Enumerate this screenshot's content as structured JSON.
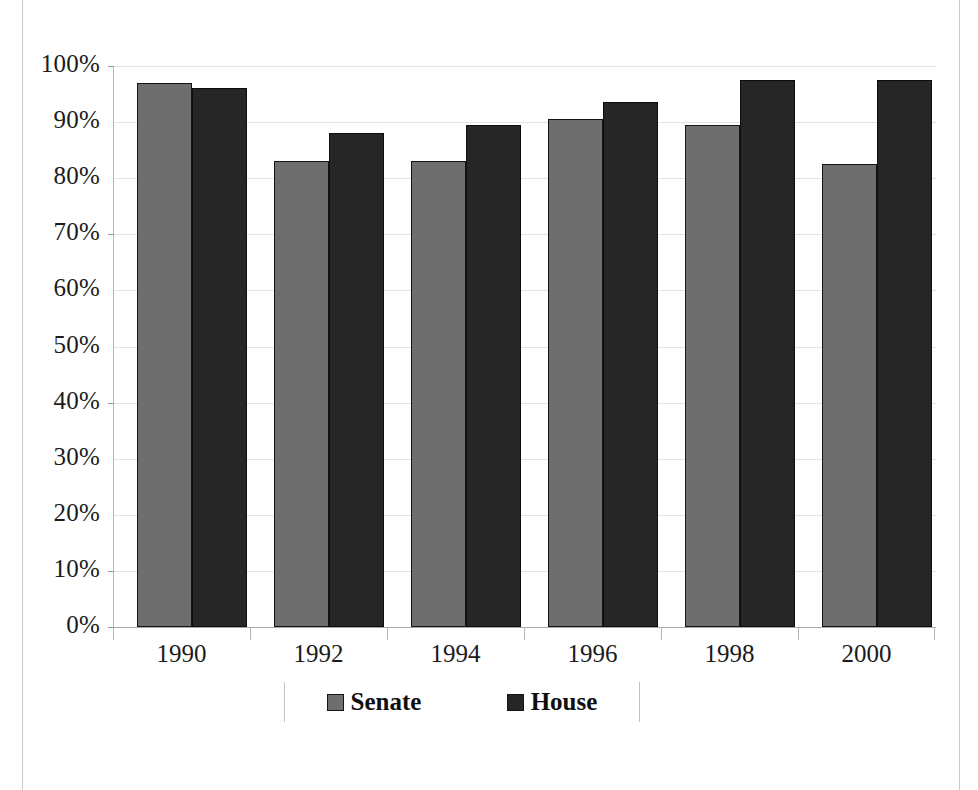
{
  "chart_data": {
    "type": "bar",
    "title": "",
    "subtitle": "",
    "xlabel": "",
    "ylabel": "",
    "categories": [
      "1990",
      "1992",
      "1994",
      "1996",
      "1998",
      "2000"
    ],
    "series": [
      {
        "name": "Senate",
        "color": "#6e6e6e",
        "values": [
          97,
          83,
          83,
          90.5,
          89.5,
          82.5
        ]
      },
      {
        "name": "House",
        "color": "#262626",
        "values": [
          96,
          88,
          89.5,
          93.5,
          97.5,
          97.5
        ]
      }
    ],
    "ylim": [
      0,
      100
    ],
    "ytick_values": [
      0,
      10,
      20,
      30,
      40,
      50,
      60,
      70,
      80,
      90,
      100
    ],
    "ytick_labels": [
      "0%",
      "10%",
      "20%",
      "30%",
      "40%",
      "50%",
      "60%",
      "70%",
      "80%",
      "90%",
      "100%"
    ],
    "grid": true,
    "legend_position": "bottom",
    "legend_entries": [
      "Senate",
      "House"
    ]
  },
  "axis": {
    "y": {
      "labels": [
        "100%",
        "90%",
        "80%",
        "70%",
        "60%",
        "50%",
        "40%",
        "30%",
        "20%",
        "10%",
        "0%"
      ]
    },
    "x": {
      "labels": [
        "1990",
        "1992",
        "1994",
        "1996",
        "1998",
        "2000"
      ]
    }
  },
  "legend": {
    "items": [
      {
        "label": "Senate",
        "swatch_color": "#6e6e6e"
      },
      {
        "label": "House",
        "swatch_color": "#262626"
      }
    ]
  }
}
